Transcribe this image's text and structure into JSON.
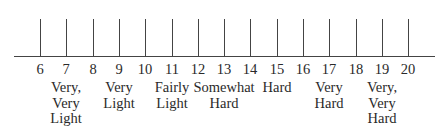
{
  "diagram": {
    "type": "rating-scale",
    "title": "",
    "scale": {
      "min": 6,
      "max": 20,
      "ticks": [
        6,
        7,
        8,
        9,
        10,
        11,
        12,
        13,
        14,
        15,
        16,
        17,
        18,
        19,
        20
      ]
    },
    "anchors": [
      {
        "value": 7,
        "label": "Very,\nVery\nLight"
      },
      {
        "value": 9,
        "label": "Very\nLight"
      },
      {
        "value": 11,
        "label": "Fairly\nLight"
      },
      {
        "value": 13,
        "label": "Somewhat\nHard"
      },
      {
        "value": 15,
        "label": "Hard"
      },
      {
        "value": 17,
        "label": "Very\nHard"
      },
      {
        "value": 19,
        "label": "Very,\nVery\nHard"
      }
    ]
  },
  "layout": {
    "first_tick_x": 40,
    "tick_spacing": 26.3
  }
}
